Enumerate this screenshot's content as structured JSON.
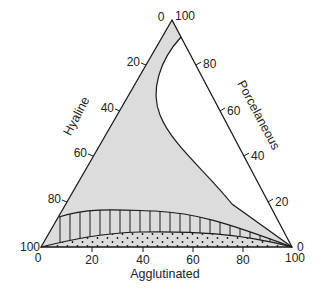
{
  "diagram": {
    "type": "ternary",
    "axes": {
      "bottom": {
        "title": "Agglutinated",
        "ticks": [
          "0",
          "20",
          "40",
          "60",
          "80",
          "100"
        ]
      },
      "left": {
        "title": "Hyaline",
        "ticks": [
          "0",
          "20",
          "40",
          "60",
          "80",
          "100"
        ]
      },
      "right": {
        "title": "Porcelaneous",
        "ticks": [
          "100",
          "80",
          "60",
          "40",
          "20",
          "0"
        ]
      }
    },
    "vertex_labels": {
      "top_left": "0",
      "top_right": "100",
      "bottom_left_upper": "100",
      "bottom_left_lower": "0",
      "bottom_right_upper": "0",
      "bottom_right_lower": "100"
    },
    "regions": [
      {
        "name": "shaded-region",
        "fill": "grey",
        "description": "Grey field bounded by the concave curve on the right"
      },
      {
        "name": "hatched-region",
        "fill": "vertical-lines",
        "description": "Vertically hatched band along the base"
      },
      {
        "name": "dotted-region",
        "fill": "stipple",
        "description": "Dotted band along the Agglutinated axis"
      }
    ],
    "colors": {
      "line": "#1a1a1a",
      "shade": "#dcdcdc",
      "background": "#ffffff"
    }
  }
}
